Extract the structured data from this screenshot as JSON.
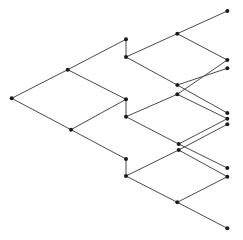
{
  "diagram": {
    "type": "binary-tree-lattice",
    "colors": {
      "edge": "#4a4a4a",
      "node": "#1a1a1a",
      "background": "#ffffff"
    },
    "node_radius": 2,
    "nodes": [
      {
        "id": "root",
        "x": 11.7,
        "y": 98.3
      },
      {
        "id": "l1-top",
        "x": 67.7,
        "y": 69.7
      },
      {
        "id": "l1-bot",
        "x": 71.0,
        "y": 129.7
      },
      {
        "id": "l2-a-top",
        "x": 126.0,
        "y": 39.3
      },
      {
        "id": "l2-a-bot",
        "x": 126.0,
        "y": 57.0
      },
      {
        "id": "l2-b-top",
        "x": 126.0,
        "y": 99.3
      },
      {
        "id": "l2-b-bot",
        "x": 126.0,
        "y": 116.7
      },
      {
        "id": "l2-c-top",
        "x": 126.0,
        "y": 159.0
      },
      {
        "id": "l2-c-bot",
        "x": 126.0,
        "y": 176.0
      },
      {
        "id": "l3-1",
        "x": 177.3,
        "y": 33.7
      },
      {
        "id": "l3-2",
        "x": 177.3,
        "y": 85.0
      },
      {
        "id": "l3-3",
        "x": 177.3,
        "y": 94.3
      },
      {
        "id": "l3-4",
        "x": 178.7,
        "y": 144.0
      },
      {
        "id": "l3-5",
        "x": 178.7,
        "y": 150.0
      },
      {
        "id": "l3-6",
        "x": 177.3,
        "y": 202.3
      },
      {
        "id": "l4-1",
        "x": 227.3,
        "y": 11.0
      },
      {
        "id": "l4-2",
        "x": 227.3,
        "y": 60.0
      },
      {
        "id": "l4-3",
        "x": 227.3,
        "y": 68.3
      },
      {
        "id": "l4-4",
        "x": 227.3,
        "y": 113.0
      },
      {
        "id": "l4-5",
        "x": 227.3,
        "y": 118.7
      },
      {
        "id": "l4-6",
        "x": 227.3,
        "y": 124.3
      },
      {
        "id": "l4-7",
        "x": 227.3,
        "y": 168.0
      },
      {
        "id": "l4-8",
        "x": 227.3,
        "y": 176.7
      },
      {
        "id": "l4-9",
        "x": 227.3,
        "y": 228.3
      }
    ],
    "edges": [
      [
        "root",
        "l1-top"
      ],
      [
        "root",
        "l1-bot"
      ],
      [
        "l1-top",
        "l2-a-top"
      ],
      [
        "l1-top",
        "l2-b-top"
      ],
      [
        "l1-bot",
        "l2-b-top"
      ],
      [
        "l1-bot",
        "l2-c-top"
      ],
      [
        "l2-a-top",
        "l2-a-bot"
      ],
      [
        "l2-b-top",
        "l2-b-bot"
      ],
      [
        "l2-c-top",
        "l2-c-bot"
      ],
      [
        "l2-a-bot",
        "l3-1"
      ],
      [
        "l2-a-bot",
        "l3-2"
      ],
      [
        "l2-b-bot",
        "l3-3"
      ],
      [
        "l2-b-bot",
        "l3-4"
      ],
      [
        "l2-c-bot",
        "l3-5"
      ],
      [
        "l2-c-bot",
        "l3-6"
      ],
      [
        "l3-1",
        "l4-1"
      ],
      [
        "l3-1",
        "l4-2"
      ],
      [
        "l3-2",
        "l4-3"
      ],
      [
        "l3-2",
        "l4-4"
      ],
      [
        "l3-3",
        "l4-2"
      ],
      [
        "l3-3",
        "l4-5"
      ],
      [
        "l3-4",
        "l4-5"
      ],
      [
        "l3-4",
        "l4-7"
      ],
      [
        "l3-5",
        "l4-6"
      ],
      [
        "l3-5",
        "l4-8"
      ],
      [
        "l3-6",
        "l4-8"
      ],
      [
        "l3-6",
        "l4-9"
      ]
    ]
  }
}
